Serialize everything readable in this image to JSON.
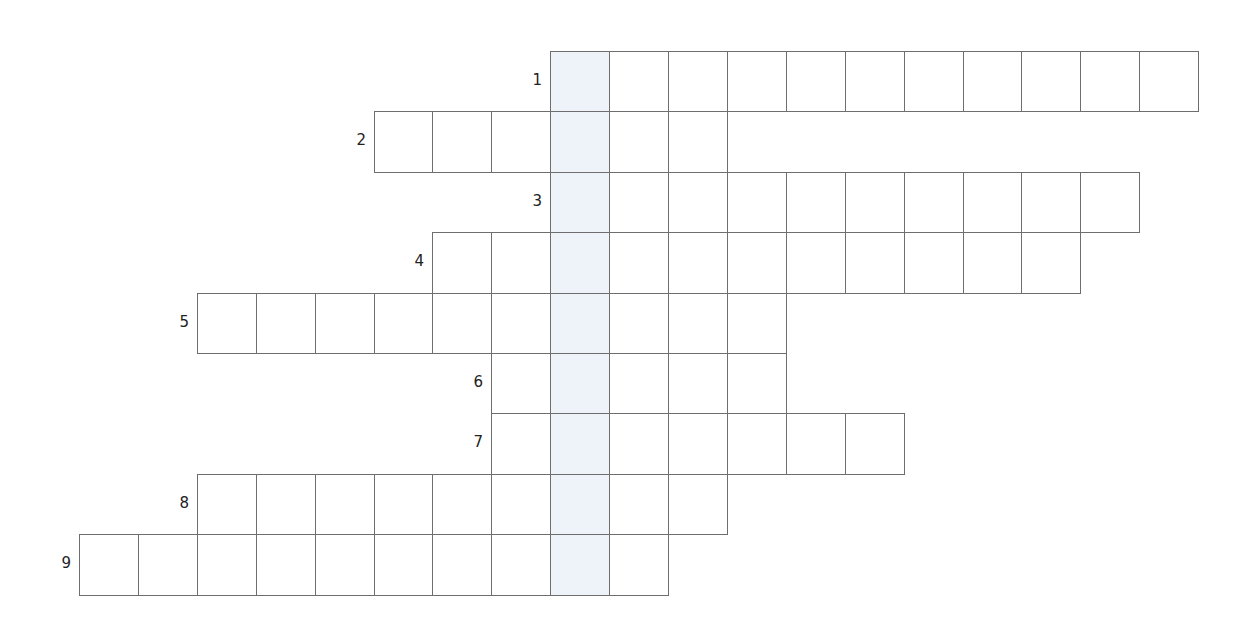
{
  "puzzle": {
    "type": "crossword",
    "highlight_column": 8,
    "highlight_color": "#eef3f9",
    "line_color": "#6e6e6e",
    "grid_origin": {
      "x": 79,
      "y": 51
    },
    "cell_size": 58.9,
    "row_height": 60.4,
    "rows": [
      {
        "number": "1",
        "start_col": 8,
        "length": 11
      },
      {
        "number": "2",
        "start_col": 5,
        "length": 6
      },
      {
        "number": "3",
        "start_col": 8,
        "length": 10
      },
      {
        "number": "4",
        "start_col": 6,
        "length": 11
      },
      {
        "number": "5",
        "start_col": 2,
        "length": 10
      },
      {
        "number": "6",
        "start_col": 7,
        "length": 5
      },
      {
        "number": "7",
        "start_col": 7,
        "length": 7
      },
      {
        "number": "8",
        "start_col": 2,
        "length": 9
      },
      {
        "number": "9",
        "start_col": 0,
        "length": 10
      }
    ]
  }
}
